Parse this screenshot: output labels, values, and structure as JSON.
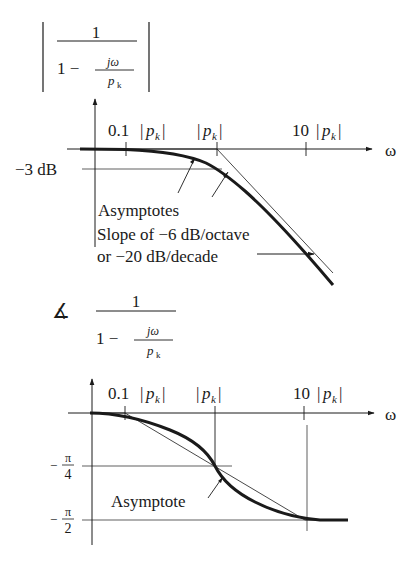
{
  "top_plot": {
    "formula": {
      "numerator": "1",
      "denominator_prefix": "1 −",
      "inner_numerator": "jω",
      "inner_denominator_var": "p",
      "inner_denominator_sub": "k",
      "bars": "magnitude"
    },
    "x_axis_label": "ω",
    "ticks": [
      {
        "coef": "0.1",
        "var": "p",
        "sub": "k"
      },
      {
        "coef": "",
        "var": "p",
        "sub": "k"
      },
      {
        "coef": "10",
        "var": "p",
        "sub": "k"
      }
    ],
    "y_label": "−3 dB",
    "annotations": {
      "asymptotes": "Asymptotes",
      "slope_line1": "Slope of −6 dB/octave",
      "slope_line2": "or −20 dB/decade"
    }
  },
  "bottom_plot": {
    "formula": {
      "angle_symbol": "∡",
      "numerator": "1",
      "denominator_prefix": "1 −",
      "inner_numerator": "jω",
      "inner_denominator_var": "p",
      "inner_denominator_sub": "k"
    },
    "x_axis_label": "ω",
    "ticks": [
      {
        "coef": "0.1",
        "var": "p",
        "sub": "k"
      },
      {
        "coef": "",
        "var": "p",
        "sub": "k"
      },
      {
        "coef": "10",
        "var": "p",
        "sub": "k"
      }
    ],
    "y_labels": [
      {
        "num": "π",
        "den": "4",
        "sign": "−"
      },
      {
        "num": "π",
        "den": "2",
        "sign": "−"
      }
    ],
    "annotations": {
      "asymptote": "Asymptote"
    }
  },
  "colors": {
    "ink": "#1a1a1a",
    "background": "#ffffff"
  }
}
